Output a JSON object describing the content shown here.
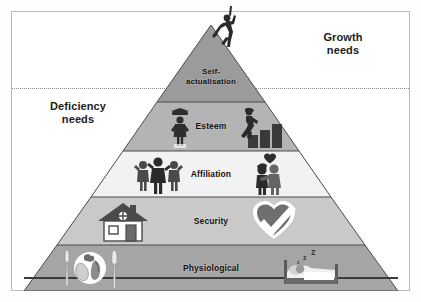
{
  "diagram": {
    "type": "pyramid",
    "zones": {
      "growth": {
        "label": "Growth\nneeds",
        "line1": "Growth",
        "line2": "needs"
      },
      "deficiency": {
        "label": "Deficiency\nneeds",
        "line1": "Deficiency",
        "line2": "needs"
      }
    },
    "divider": {
      "style": "dotted",
      "color": "#8e8e8e"
    },
    "tiers": [
      {
        "id": "self-actualisation",
        "level": 5,
        "line1": "Self-",
        "line2": "actualisation",
        "label": "Self-actualisation",
        "zone": "growth",
        "fill": "#9b9b9b",
        "icons": [
          "climbing-person-icon"
        ]
      },
      {
        "id": "esteem",
        "level": 4,
        "label": "Esteem",
        "zone": "deficiency",
        "fill": "#b4b4b4",
        "icons": [
          "graduate-person-icon",
          "person-climbing-bars-icon"
        ]
      },
      {
        "id": "affiliation",
        "level": 3,
        "label": "Affiliation",
        "zone": "deficiency",
        "fill": "#f2f2f2",
        "icons": [
          "family-group-icon",
          "couple-with-heart-icon"
        ]
      },
      {
        "id": "security",
        "level": 2,
        "label": "Security",
        "zone": "deficiency",
        "fill": "#c9c9c9",
        "icons": [
          "house-icon",
          "heart-check-icon"
        ]
      },
      {
        "id": "physiological",
        "level": 1,
        "label": "Physiological",
        "zone": "deficiency",
        "fill": "#a5a5a5",
        "icons": [
          "food-plate-cutlery-icon",
          "sleeping-person-bed-icon"
        ]
      }
    ],
    "colors": {
      "frame_border": "#b9b9b9",
      "pyramid_outline": "#4a4a4a",
      "baseline": "#3b3b3b",
      "text": "#111111",
      "background": "#ffffff"
    }
  }
}
